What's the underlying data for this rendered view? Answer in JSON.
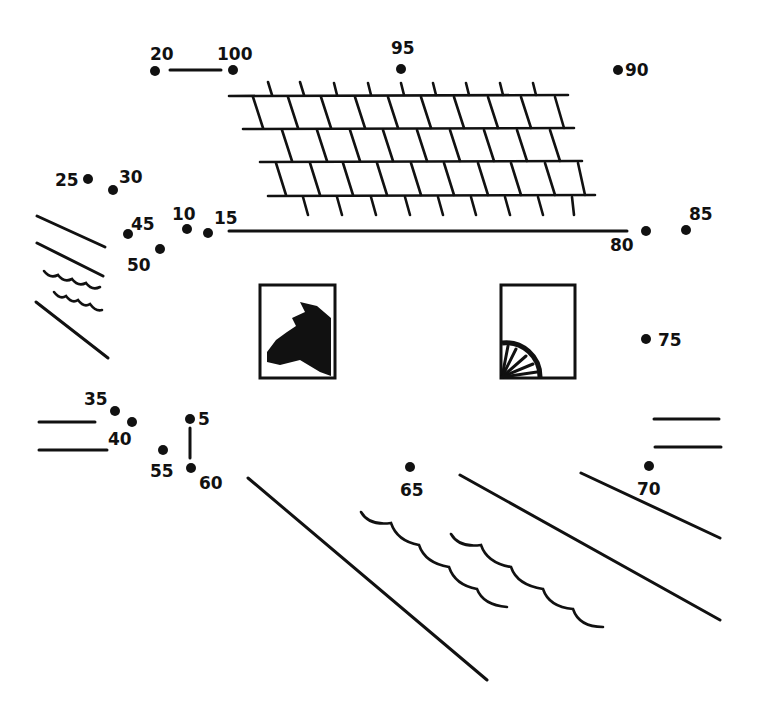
{
  "worksheet": {
    "type": "dot-to-dot",
    "subject": "barn with cow and wagon wheel",
    "ink_color": "#111111",
    "background_color": "#ffffff"
  },
  "dots": [
    {
      "n": "5",
      "x": 190,
      "y": 419,
      "lx": 198,
      "ly": 425
    },
    {
      "n": "10",
      "x": 187,
      "y": 229,
      "lx": 172,
      "ly": 220
    },
    {
      "n": "15",
      "x": 208,
      "y": 233,
      "lx": 214,
      "ly": 224
    },
    {
      "n": "20",
      "x": 155,
      "y": 71,
      "lx": 150,
      "ly": 60
    },
    {
      "n": "25",
      "x": 88,
      "y": 179,
      "lx": 55,
      "ly": 186
    },
    {
      "n": "30",
      "x": 113,
      "y": 190,
      "lx": 119,
      "ly": 183
    },
    {
      "n": "35",
      "x": 115,
      "y": 411,
      "lx": 84,
      "ly": 405
    },
    {
      "n": "40",
      "x": 132,
      "y": 422,
      "lx": 108,
      "ly": 445
    },
    {
      "n": "45",
      "x": 128,
      "y": 234,
      "lx": 131,
      "ly": 230
    },
    {
      "n": "50",
      "x": 160,
      "y": 249,
      "lx": 127,
      "ly": 271
    },
    {
      "n": "55",
      "x": 163,
      "y": 450,
      "lx": 150,
      "ly": 477
    },
    {
      "n": "60",
      "x": 191,
      "y": 468,
      "lx": 199,
      "ly": 489
    },
    {
      "n": "65",
      "x": 410,
      "y": 467,
      "lx": 400,
      "ly": 496
    },
    {
      "n": "70",
      "x": 649,
      "y": 466,
      "lx": 637,
      "ly": 495
    },
    {
      "n": "75",
      "x": 646,
      "y": 339,
      "lx": 658,
      "ly": 346
    },
    {
      "n": "80",
      "x": 646,
      "y": 231,
      "lx": 610,
      "ly": 251
    },
    {
      "n": "85",
      "x": 686,
      "y": 230,
      "lx": 689,
      "ly": 220
    },
    {
      "n": "90",
      "x": 618,
      "y": 70,
      "lx": 625,
      "ly": 76
    },
    {
      "n": "95",
      "x": 401,
      "y": 69,
      "lx": 391,
      "ly": 54
    },
    {
      "n": "100",
      "x": 233,
      "y": 70,
      "lx": 217,
      "ly": 60
    }
  ],
  "windows": [
    {
      "name": "cow-window",
      "x": 260,
      "y": 285,
      "w": 75,
      "h": 93,
      "content": "cow head silhouette"
    },
    {
      "name": "wheel-window",
      "x": 501,
      "y": 285,
      "w": 74,
      "h": 93,
      "content": "wagon wheel quarter"
    }
  ]
}
